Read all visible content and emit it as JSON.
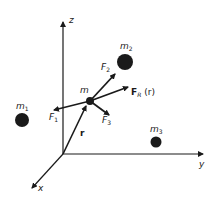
{
  "diagram": {
    "title": "",
    "axes": {
      "z": {
        "label": "z"
      },
      "y": {
        "label": "y"
      },
      "x": {
        "label": "x"
      }
    },
    "masses": {
      "m": {
        "label": "m"
      },
      "m1": {
        "label": "m",
        "sub": "1"
      },
      "m2": {
        "label": "m",
        "sub": "2"
      },
      "m3": {
        "label": "m",
        "sub": "3"
      }
    },
    "vectors": {
      "r": {
        "label": "r"
      },
      "F1": {
        "label": "F",
        "sub": "1"
      },
      "F2": {
        "label": "F",
        "sub": "2"
      },
      "F3": {
        "label": "F",
        "sub": "3"
      },
      "FR": {
        "label": "F",
        "sub": "R",
        "suffix": "(r)"
      }
    },
    "colors": {
      "ink": "#1a1a1a",
      "background": "#ffffff"
    }
  }
}
